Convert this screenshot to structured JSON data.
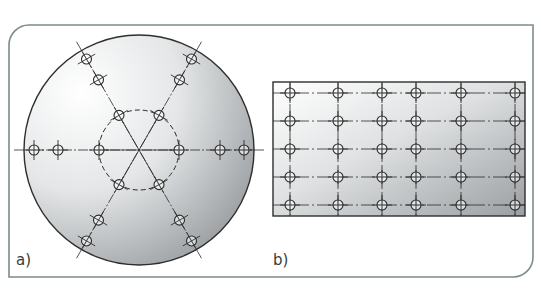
{
  "figure": {
    "frame_color": "#7d8c86",
    "panels": [
      {
        "id": "a",
        "label": "a)",
        "title": "Circular plate with holes on radial lines (polar pattern)",
        "shape": "circle",
        "center": [
          139,
          150
        ],
        "radius": 115,
        "inner_pitch_circle_radius": 40,
        "radial_line_angles_deg": [
          0,
          60,
          120,
          180,
          240,
          300
        ],
        "hole_radial_distances": [
          40,
          81,
          105
        ],
        "hole_count": 18,
        "gradient": {
          "light": "#ffffff",
          "dark": "#8e9396"
        }
      },
      {
        "id": "b",
        "label": "b)",
        "title": "Rectangular plate with holes on a rectangular grid",
        "shape": "rectangle",
        "bounds": {
          "x": 273,
          "y": 82,
          "width": 252,
          "height": 134
        },
        "column_x": [
          290,
          338,
          382,
          416,
          461,
          515
        ],
        "row_y": [
          93,
          121,
          149,
          177,
          205
        ],
        "hole_count": 30,
        "gradient": {
          "light": "#ffffff",
          "dark": "#9a9fa2"
        }
      }
    ],
    "hole_radius": 5,
    "line_color": "#2b2b2b"
  }
}
